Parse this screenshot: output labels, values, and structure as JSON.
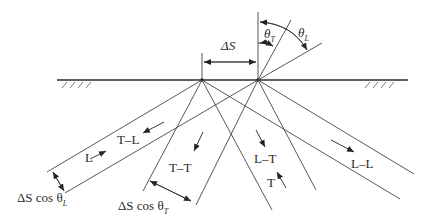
{
  "diagram": {
    "labels": {
      "delta_s": "ΔS",
      "theta_t": "θ",
      "theta_t_sub": "T",
      "theta_l": "θ",
      "theta_l_sub": "L",
      "t_l": "T–L",
      "l": "L",
      "t_t": "T–T",
      "l_t": "L–T",
      "t": "T",
      "l_l": "L–L",
      "dscos_l_prefix": "ΔS cos θ",
      "dscos_l_sub": "L",
      "dscos_t_prefix": "ΔS cos θ",
      "dscos_t_sub": "T"
    },
    "colors": {
      "line": "#3a3a3a",
      "surface": "#2a2a2a"
    }
  }
}
